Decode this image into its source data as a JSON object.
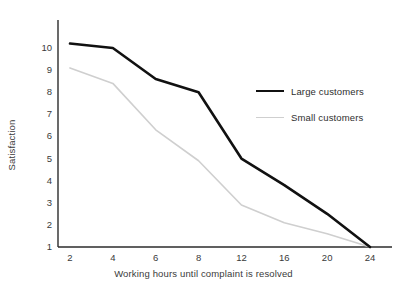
{
  "chart_data": {
    "type": "line",
    "title": "",
    "subtitle": "",
    "xlabel": "Working hours until complaint is resolved",
    "ylabel": "Satisfaction",
    "categories": [
      "2",
      "4",
      "6",
      "8",
      "12",
      "16",
      "20",
      "24"
    ],
    "x": [
      2,
      4,
      6,
      8,
      12,
      16,
      20,
      24
    ],
    "ylim": [
      1,
      10
    ],
    "xlim": [
      2,
      24
    ],
    "y_ticks": [
      "10",
      "9",
      "8",
      "7",
      "6",
      "5",
      "4",
      "3",
      "2",
      "1"
    ],
    "x_ticks": [
      "2",
      "4",
      "6",
      "8",
      "12",
      "16",
      "20",
      "24"
    ],
    "grid": false,
    "legend_position": "center-right",
    "series": [
      {
        "name": "Large customers",
        "color": "#111111",
        "width": 2.6,
        "values": [
          10.2,
          10.0,
          8.6,
          8.0,
          5.0,
          3.8,
          2.5,
          1.0
        ]
      },
      {
        "name": "Small customers",
        "color": "#cfcfcf",
        "width": 1.6,
        "values": [
          9.1,
          8.4,
          6.3,
          4.9,
          2.9,
          2.1,
          1.6,
          1.0
        ]
      }
    ],
    "annotations": []
  },
  "legend": {
    "items": [
      {
        "label": "Large customers",
        "swatch": "thick-black-line"
      },
      {
        "label": "Small customers",
        "swatch": "thin-gray-line"
      }
    ]
  },
  "axes": {
    "y_title": "Satisfaction",
    "x_title": "Working hours until complaint is resolved",
    "axis_color": "#2b2b2b"
  }
}
